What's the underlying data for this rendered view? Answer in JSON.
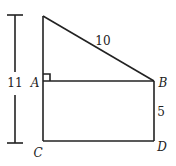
{
  "diagram": {
    "type": "geometry-figure",
    "colors": {
      "stroke": "#222222",
      "background": "#ffffff"
    },
    "dimension": {
      "label": "11",
      "description": "total height from top vertex to C"
    },
    "segments": {
      "hypotenuse_length": "10",
      "BD_length": "5"
    },
    "points": {
      "A": "A",
      "B": "B",
      "C": "C",
      "D": "D"
    },
    "marks": {
      "right_angle_at": "A"
    }
  }
}
